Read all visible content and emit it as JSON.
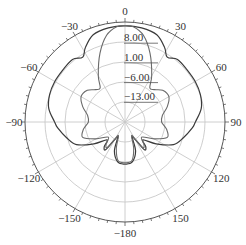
{
  "chart_data": {
    "type": "line",
    "subtype": "polar",
    "title": "",
    "theta_direction": "clockwise",
    "theta_zero": "top",
    "angle_ticks": [
      0,
      30,
      60,
      90,
      120,
      150,
      -180,
      -150,
      -120,
      -90,
      -60,
      -30
    ],
    "angle_labels": [
      "0",
      "30",
      "60",
      "90",
      "120",
      "150",
      "−180",
      "−150",
      "−120",
      "−90",
      "−60",
      "−30"
    ],
    "radial_ticks": [
      8.0,
      1.0,
      -6.0,
      -13.0
    ],
    "radial_labels": [
      "8.00",
      "1.00",
      "−6.00",
      "−13.00"
    ],
    "rlim": [
      -20,
      15
    ],
    "grid": true,
    "legend": [],
    "series": [
      {
        "name": "pattern-1",
        "color": "#3a3a3a",
        "theta": [
          -180,
          -170,
          -160,
          -155,
          -150,
          -145,
          -140,
          -135,
          -125,
          -115,
          -105,
          -95,
          -90,
          -80,
          -70,
          -60,
          -50,
          -40,
          -33,
          -28,
          -20,
          -10,
          0,
          10,
          20,
          28,
          33,
          40,
          50,
          60,
          70,
          80,
          90,
          95,
          105,
          115,
          125,
          135,
          140,
          145,
          150,
          155,
          160,
          170,
          180
        ],
        "r": [
          -5.0,
          -5.5,
          -9.0,
          -14.0,
          -13.0,
          -8.0,
          -8.5,
          -11.0,
          -6.5,
          -1.0,
          1.5,
          4.0,
          5.0,
          7.5,
          8.5,
          8.8,
          8.8,
          9.0,
          7.5,
          10.0,
          13.0,
          14.0,
          14.2,
          14.0,
          13.0,
          10.0,
          7.5,
          9.0,
          8.8,
          8.8,
          8.5,
          7.5,
          5.0,
          4.0,
          1.5,
          -1.0,
          -6.5,
          -11.0,
          -8.5,
          -8.0,
          -13.0,
          -14.0,
          -9.0,
          -5.5,
          -5.0
        ]
      },
      {
        "name": "pattern-2",
        "color": "#6a6a6a",
        "theta": [
          -180,
          -170,
          -162,
          -155,
          -150,
          -145,
          -140,
          -132,
          -120,
          -110,
          -100,
          -90,
          -80,
          -70,
          -60,
          -50,
          -42,
          -36,
          -30,
          -20,
          -12,
          -5,
          0,
          5,
          12,
          20,
          30,
          36,
          42,
          50,
          60,
          70,
          80,
          90,
          100,
          110,
          120,
          132,
          140,
          145,
          150,
          155,
          162,
          170,
          180
        ],
        "r": [
          -5.5,
          -6.0,
          -10.0,
          -14.5,
          -13.5,
          -9.0,
          -9.5,
          -12.0,
          -8.0,
          -4.0,
          -5.0,
          -7.0,
          -6.5,
          -4.0,
          -2.0,
          -2.5,
          -4.5,
          -5.0,
          -1.0,
          6.0,
          11.5,
          14.0,
          14.3,
          14.0,
          11.5,
          6.0,
          -1.0,
          -5.0,
          -4.5,
          -2.5,
          -2.0,
          -4.0,
          -6.5,
          -7.0,
          -5.0,
          -4.0,
          -8.0,
          -12.0,
          -9.5,
          -9.0,
          -13.5,
          -14.5,
          -10.0,
          -6.0,
          -5.5
        ]
      }
    ]
  }
}
